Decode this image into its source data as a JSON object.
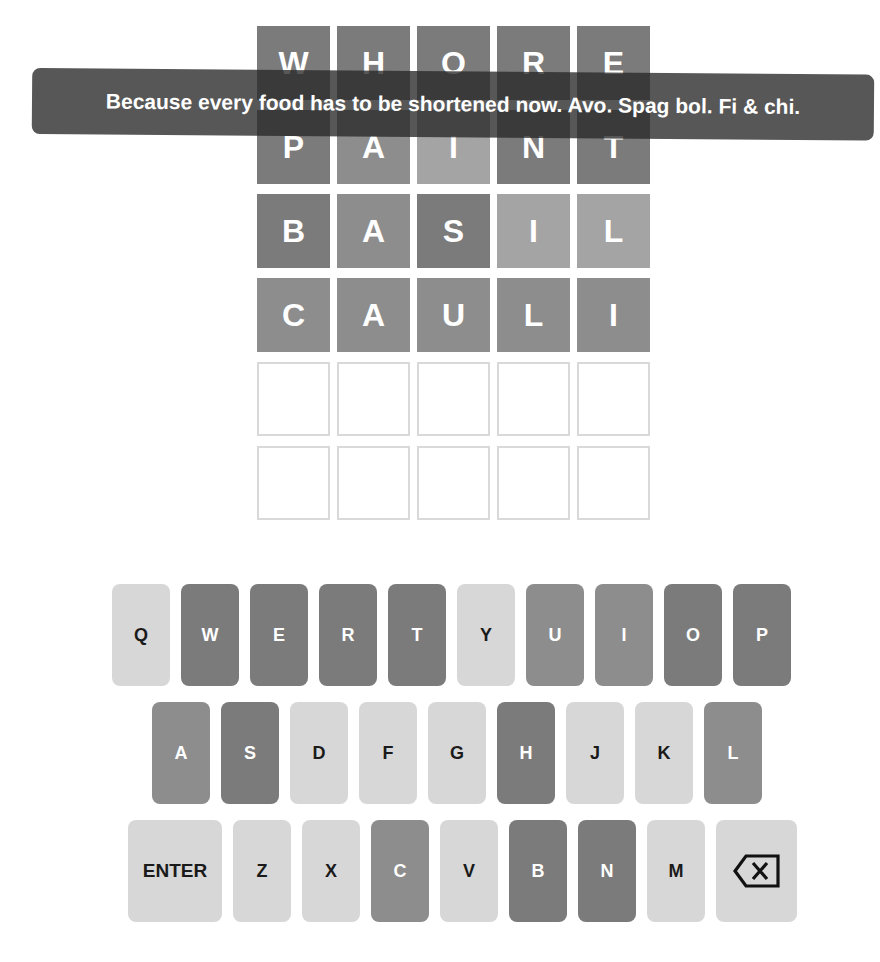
{
  "board": {
    "rows": [
      {
        "tiles": [
          {
            "letter": "W",
            "state": "absent"
          },
          {
            "letter": "H",
            "state": "absent"
          },
          {
            "letter": "O",
            "state": "absent"
          },
          {
            "letter": "R",
            "state": "absent"
          },
          {
            "letter": "E",
            "state": "absent"
          }
        ]
      },
      {
        "tiles": [
          {
            "letter": "P",
            "state": "absent"
          },
          {
            "letter": "A",
            "state": "correct"
          },
          {
            "letter": "I",
            "state": "present"
          },
          {
            "letter": "N",
            "state": "absent"
          },
          {
            "letter": "T",
            "state": "absent"
          }
        ]
      },
      {
        "tiles": [
          {
            "letter": "B",
            "state": "absent"
          },
          {
            "letter": "A",
            "state": "correct"
          },
          {
            "letter": "S",
            "state": "absent"
          },
          {
            "letter": "I",
            "state": "present"
          },
          {
            "letter": "L",
            "state": "present"
          }
        ]
      },
      {
        "tiles": [
          {
            "letter": "C",
            "state": "correct"
          },
          {
            "letter": "A",
            "state": "correct"
          },
          {
            "letter": "U",
            "state": "correct"
          },
          {
            "letter": "L",
            "state": "correct"
          },
          {
            "letter": "I",
            "state": "correct"
          }
        ]
      },
      {
        "tiles": [
          {
            "letter": "",
            "state": "empty"
          },
          {
            "letter": "",
            "state": "empty"
          },
          {
            "letter": "",
            "state": "empty"
          },
          {
            "letter": "",
            "state": "empty"
          },
          {
            "letter": "",
            "state": "empty"
          }
        ]
      },
      {
        "tiles": [
          {
            "letter": "",
            "state": "empty"
          },
          {
            "letter": "",
            "state": "empty"
          },
          {
            "letter": "",
            "state": "empty"
          },
          {
            "letter": "",
            "state": "empty"
          },
          {
            "letter": "",
            "state": "empty"
          }
        ]
      }
    ]
  },
  "toast": {
    "message": "Because every food has to be shortened now. Avo. Spag bol. Fi & chi."
  },
  "keyboard": {
    "rows": [
      [
        {
          "label": "Q",
          "state": "unused"
        },
        {
          "label": "W",
          "state": "absent"
        },
        {
          "label": "E",
          "state": "absent"
        },
        {
          "label": "R",
          "state": "absent"
        },
        {
          "label": "T",
          "state": "absent"
        },
        {
          "label": "Y",
          "state": "unused"
        },
        {
          "label": "U",
          "state": "correct"
        },
        {
          "label": "I",
          "state": "correct"
        },
        {
          "label": "O",
          "state": "absent"
        },
        {
          "label": "P",
          "state": "absent"
        }
      ],
      [
        {
          "label": "A",
          "state": "correct"
        },
        {
          "label": "S",
          "state": "absent"
        },
        {
          "label": "D",
          "state": "unused"
        },
        {
          "label": "F",
          "state": "unused"
        },
        {
          "label": "G",
          "state": "unused"
        },
        {
          "label": "H",
          "state": "absent"
        },
        {
          "label": "J",
          "state": "unused"
        },
        {
          "label": "K",
          "state": "unused"
        },
        {
          "label": "L",
          "state": "correct"
        }
      ],
      [
        {
          "label": "ENTER",
          "state": "unused",
          "type": "enter"
        },
        {
          "label": "Z",
          "state": "unused"
        },
        {
          "label": "X",
          "state": "unused"
        },
        {
          "label": "C",
          "state": "correct"
        },
        {
          "label": "V",
          "state": "unused"
        },
        {
          "label": "B",
          "state": "absent"
        },
        {
          "label": "N",
          "state": "absent"
        },
        {
          "label": "M",
          "state": "unused"
        },
        {
          "label": "",
          "state": "unused",
          "type": "backspace",
          "icon": "backspace-icon"
        }
      ]
    ]
  },
  "colors": {
    "absent": "#7b7b7b",
    "correct": "#8d8d8d",
    "present": "#a4a4a4",
    "unused_key": "#d7d7d7",
    "empty_border": "#d9d9d9",
    "toast_bg": "rgba(40,40,40,0.78)"
  }
}
